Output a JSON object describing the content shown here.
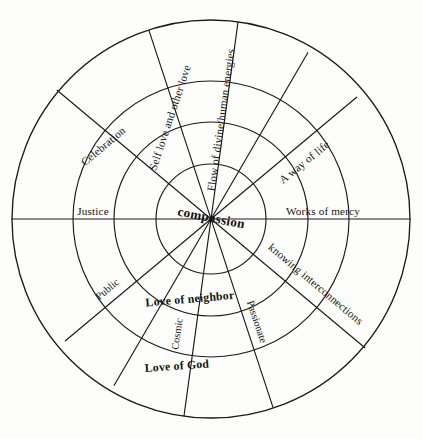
{
  "diagram": {
    "title": "compassion",
    "type": "concentric-wheel",
    "center_label": "compassion",
    "geometry": {
      "center_x": 211,
      "center_y": 219,
      "ring_radii": [
        55,
        97,
        138,
        199
      ],
      "spoke_count": 8
    },
    "colors": {
      "stroke": "#1a1a18",
      "text": "#141412",
      "background": "#fdfdfc"
    },
    "labels": {
      "self_love_and_other_love": "Self love and other love",
      "flow_of_divine_human_energies": "Flow of divine/human energies",
      "a_way_of_life": "A way of life",
      "celebration": "Celebration",
      "justice": "Justice",
      "works_of_mercy": "Works of mercy",
      "knowing_interconnections": "knowing interconnections",
      "public": "Public",
      "cosmic": "Cosmic",
      "passionate": "Passionate",
      "love_of_neighbor": "Love of neighbor",
      "love_of_god": "Love of God"
    }
  }
}
